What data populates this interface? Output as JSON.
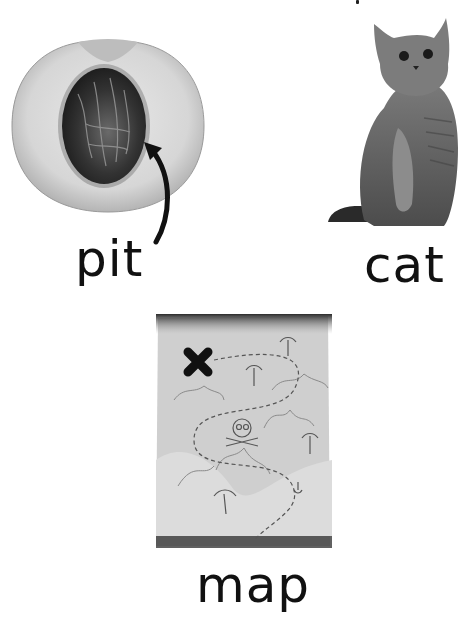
{
  "cards": [
    {
      "word": "pit",
      "image": "peach-halved-with-pit-icon",
      "annotation": "curved arrow pointing to pit"
    },
    {
      "word": "cat",
      "image": "sitting-cat-icon"
    },
    {
      "word": "map",
      "image": "treasure-map-icon"
    }
  ],
  "colors": {
    "text": "#111111",
    "background": "#ffffff"
  }
}
